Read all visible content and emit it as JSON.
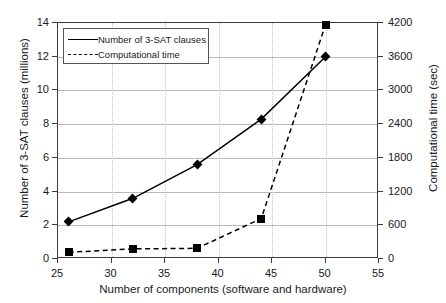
{
  "chart_data": {
    "type": "line",
    "title": "",
    "xlabel": "Number of components (software and hardware)",
    "x": [
      26,
      32,
      38,
      44,
      50
    ],
    "xlim": [
      25,
      55
    ],
    "xticks": [
      25,
      30,
      35,
      40,
      45,
      50,
      55
    ],
    "grid": true,
    "legend_position": "upper-left",
    "axes": [
      {
        "id": "left",
        "ylabel": "Number of 3-SAT clauses (millions)",
        "ylim": [
          0,
          14
        ],
        "yticks": [
          0,
          2,
          4,
          6,
          8,
          10,
          12,
          14
        ]
      },
      {
        "id": "right",
        "ylabel": "Computational time (sec)",
        "ylim": [
          0,
          4200
        ],
        "yticks": [
          0,
          600,
          1200,
          1800,
          2400,
          3000,
          3600,
          4200
        ]
      }
    ],
    "series": [
      {
        "name": "Number of 3-SAT clauses",
        "axis": "left",
        "marker": "diamond",
        "linestyle": "solid",
        "color": "#000000",
        "values": [
          2.2,
          3.6,
          5.6,
          8.3,
          12.0
        ]
      },
      {
        "name": "Computational time",
        "axis": "right",
        "marker": "square",
        "linestyle": "dashed",
        "color": "#000000",
        "values": [
          120,
          180,
          190,
          720,
          4170
        ]
      }
    ]
  },
  "legend": {
    "items": [
      {
        "label": "Number of 3-SAT clauses"
      },
      {
        "label": "Computational time"
      }
    ]
  }
}
